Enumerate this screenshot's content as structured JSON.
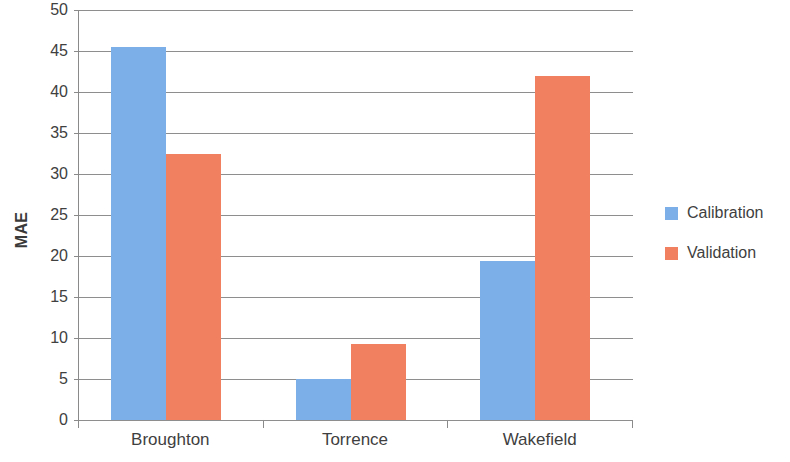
{
  "chart_data": {
    "type": "bar",
    "title": "",
    "subtitle": "",
    "xlabel": "",
    "ylabel": "MAE",
    "categories": [
      "Broughton",
      "Torrence",
      "Wakefield"
    ],
    "series": [
      {
        "name": "Calibration",
        "color": "#7CAFE8",
        "values": [
          45.5,
          5.0,
          19.4
        ]
      },
      {
        "name": "Validation",
        "color": "#F08060",
        "values": [
          32.4,
          9.3,
          41.9
        ]
      }
    ],
    "ylim": [
      0,
      50
    ],
    "ytick_step": 5,
    "yticks": [
      0,
      5,
      10,
      15,
      20,
      25,
      30,
      35,
      40,
      45,
      50
    ],
    "ytick_labels": [
      "0",
      "5",
      "10",
      "15",
      "20",
      "25",
      "30",
      "35",
      "40",
      "45",
      "50"
    ],
    "grid": true,
    "grid_axis": "y",
    "legend_position": "right",
    "legend_entries": [
      "Calibration",
      "Validation"
    ],
    "annotations": [],
    "axis_color": "#8a8a8a",
    "grid_color": "#8e8e8e",
    "text_color": "#3f3f3f",
    "background": "#ffffff"
  }
}
